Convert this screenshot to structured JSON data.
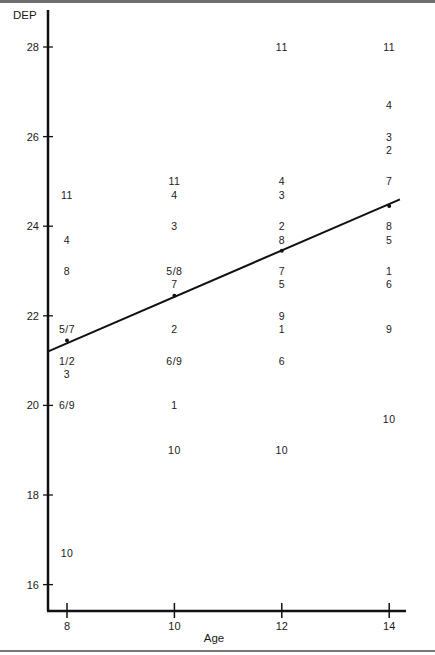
{
  "chart_data": {
    "type": "scatter",
    "title": "",
    "xlabel": "Age",
    "ylabel": "DEP",
    "xlim": [
      7.6,
      14.3
    ],
    "ylim": [
      15.4,
      28.8
    ],
    "x_ticks": [
      8,
      10,
      12,
      14
    ],
    "y_ticks": [
      16,
      18,
      20,
      22,
      24,
      26,
      28
    ],
    "grid": false,
    "legend": null,
    "marker_style": "subject-id text labels",
    "series": [
      {
        "name": "Subjects (labeled by ID)",
        "points": [
          {
            "age": 8,
            "dep": 24.7,
            "label": "11"
          },
          {
            "age": 8,
            "dep": 23.7,
            "label": "4"
          },
          {
            "age": 8,
            "dep": 23.0,
            "label": "8"
          },
          {
            "age": 8,
            "dep": 21.7,
            "label": "5/7"
          },
          {
            "age": 8,
            "dep": 21.0,
            "label": "1/2"
          },
          {
            "age": 8,
            "dep": 20.7,
            "label": "3"
          },
          {
            "age": 8,
            "dep": 20.0,
            "label": "6/9"
          },
          {
            "age": 8,
            "dep": 16.7,
            "label": "10"
          },
          {
            "age": 10,
            "dep": 25.0,
            "label": "11"
          },
          {
            "age": 10,
            "dep": 24.7,
            "label": "4"
          },
          {
            "age": 10,
            "dep": 24.0,
            "label": "3"
          },
          {
            "age": 10,
            "dep": 23.0,
            "label": "5/8"
          },
          {
            "age": 10,
            "dep": 22.7,
            "label": "7"
          },
          {
            "age": 10,
            "dep": 21.7,
            "label": "2"
          },
          {
            "age": 10,
            "dep": 21.0,
            "label": "6/9"
          },
          {
            "age": 10,
            "dep": 20.0,
            "label": "1"
          },
          {
            "age": 10,
            "dep": 19.0,
            "label": "10"
          },
          {
            "age": 12,
            "dep": 28.0,
            "label": "11"
          },
          {
            "age": 12,
            "dep": 25.0,
            "label": "4"
          },
          {
            "age": 12,
            "dep": 24.7,
            "label": "3"
          },
          {
            "age": 12,
            "dep": 24.0,
            "label": "2"
          },
          {
            "age": 12,
            "dep": 23.7,
            "label": "8"
          },
          {
            "age": 12,
            "dep": 23.0,
            "label": "7"
          },
          {
            "age": 12,
            "dep": 22.7,
            "label": "5"
          },
          {
            "age": 12,
            "dep": 22.0,
            "label": "9"
          },
          {
            "age": 12,
            "dep": 21.7,
            "label": "1"
          },
          {
            "age": 12,
            "dep": 21.0,
            "label": "6"
          },
          {
            "age": 12,
            "dep": 19.0,
            "label": "10"
          },
          {
            "age": 14,
            "dep": 28.0,
            "label": "11"
          },
          {
            "age": 14,
            "dep": 26.7,
            "label": "4"
          },
          {
            "age": 14,
            "dep": 26.0,
            "label": "3"
          },
          {
            "age": 14,
            "dep": 25.7,
            "label": "2"
          },
          {
            "age": 14,
            "dep": 25.0,
            "label": "7"
          },
          {
            "age": 14,
            "dep": 24.0,
            "label": "8"
          },
          {
            "age": 14,
            "dep": 23.7,
            "label": "5"
          },
          {
            "age": 14,
            "dep": 23.0,
            "label": "1"
          },
          {
            "age": 14,
            "dep": 22.7,
            "label": "6"
          },
          {
            "age": 14,
            "dep": 21.7,
            "label": "9"
          },
          {
            "age": 14,
            "dep": 19.7,
            "label": "10"
          }
        ]
      },
      {
        "name": "Fitted regression line",
        "type": "line",
        "x": [
          7.64,
          8,
          10,
          12,
          14,
          14.2
        ],
        "y": [
          21.2,
          21.45,
          22.45,
          23.45,
          24.45,
          24.6
        ]
      }
    ]
  }
}
